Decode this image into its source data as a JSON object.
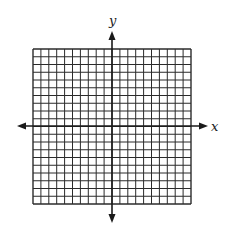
{
  "diagram": {
    "type": "coordinate-grid",
    "axes": {
      "x_label": "x",
      "y_label": "y",
      "x_arrows": "both",
      "y_arrows": "both"
    },
    "grid": {
      "columns": 20,
      "rows": 20,
      "left": 33,
      "top": 49,
      "right": 191,
      "bottom": 204,
      "line_color": "#2b2b2b"
    },
    "axis_geometry": {
      "x_axis_y": 126,
      "x_axis_from": 17,
      "x_axis_to": 208,
      "y_axis_x": 112,
      "y_axis_from": 31,
      "y_axis_to": 223,
      "axis_color": "#1a1a1a"
    }
  }
}
